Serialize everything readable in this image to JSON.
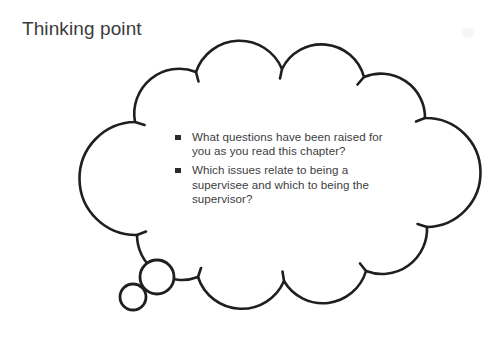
{
  "figure": {
    "heading": "Thinking point",
    "type": "thought-bubble-callout",
    "colors": {
      "background": "#ffffff",
      "outline": "#1f1f21",
      "heading_text": "#3b3b3d",
      "body_text": "#3d3d3f",
      "bullet_marker": "#2b2b2d"
    },
    "outline_stroke_width": 2.6
  },
  "bubble": {
    "name": "thought-bubble",
    "bullets": [
      {
        "marker": "square-bullet-icon",
        "text": "What questions have been raised for you as you read this chapter?"
      },
      {
        "marker": "square-bullet-icon",
        "text": "Which issues relate to being a supervisee and which to being the supervisor?"
      }
    ],
    "tail": {
      "name": "thought-tail",
      "circles": [
        {
          "label": "large-tail-bubble",
          "cx": 157,
          "cy": 277,
          "r": 17
        },
        {
          "label": "small-tail-bubble",
          "cx": 133,
          "cy": 297,
          "r": 13
        }
      ]
    }
  }
}
